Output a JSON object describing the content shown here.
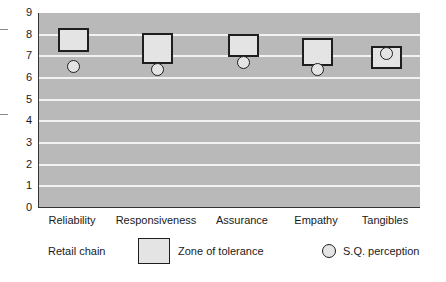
{
  "chart_data": {
    "type": "range-and-point",
    "title": "",
    "xlabel": "",
    "ylabel": "",
    "ylim": [
      0,
      9
    ],
    "yticks": [
      "0",
      "1",
      "2",
      "3",
      "4",
      "5",
      "6",
      "7",
      "8",
      "9"
    ],
    "grid": true,
    "categories": [
      "Reliability",
      "Responsiveness",
      "Assurance",
      "Empathy",
      "Tangibles"
    ],
    "series": [
      {
        "name": "Zone of tolerance",
        "kind": "range-box",
        "low": [
          7.2,
          6.65,
          6.95,
          6.55,
          6.4
        ],
        "high": [
          8.3,
          8.1,
          8.05,
          7.85,
          7.5
        ]
      },
      {
        "name": "S.Q. perception",
        "kind": "point-circle",
        "values": [
          6.55,
          6.4,
          6.7,
          6.4,
          7.15
        ]
      }
    ],
    "legend": {
      "position": "bottom",
      "title": "Retail chain",
      "entries": [
        "Zone of tolerance",
        "S.Q. perception"
      ]
    },
    "colors": {
      "plot_bg": "#b9b9b9",
      "gridline": "#f2f2f2",
      "marker_fill": "#e4e4e4",
      "marker_stroke": "#1e1e1e"
    }
  },
  "legend": {
    "group_label": "Retail chain",
    "zone_label": "Zone of tolerance",
    "perception_label": "S.Q. perception"
  }
}
